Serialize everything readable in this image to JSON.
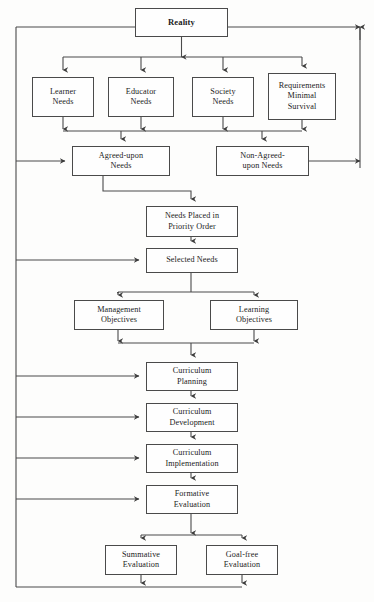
{
  "diagram": {
    "type": "flowchart",
    "background_color": "#fdfdfc",
    "line_color": "#4a4a4a",
    "text_color": "#1c1c1c",
    "nodes": [
      {
        "id": "reality",
        "label": "Reality",
        "x": 135,
        "y": 8,
        "w": 93,
        "h": 29,
        "bold": true
      },
      {
        "id": "learner-needs",
        "label": "Learner\nNeeds",
        "x": 32,
        "y": 77,
        "w": 62,
        "h": 40,
        "bold": false
      },
      {
        "id": "educator-needs",
        "label": "Educator\nNeeds",
        "x": 108,
        "y": 77,
        "w": 66,
        "h": 40,
        "bold": false
      },
      {
        "id": "society-needs",
        "label": "Society\nNeeds",
        "x": 192,
        "y": 77,
        "w": 62,
        "h": 40,
        "bold": false
      },
      {
        "id": "requirements-minimal-survival",
        "label": "Requirements\nMinimal\nSurvival",
        "x": 268,
        "y": 73,
        "w": 68,
        "h": 47,
        "bold": false
      },
      {
        "id": "agreed-upon-needs",
        "label": "Agreed-upon\nNeeds",
        "x": 72,
        "y": 146,
        "w": 98,
        "h": 30,
        "bold": false
      },
      {
        "id": "non-agreed-upon-needs",
        "label": "Non-Agreed-\nupon Needs",
        "x": 216,
        "y": 146,
        "w": 93,
        "h": 30,
        "bold": false
      },
      {
        "id": "needs-placed-priority",
        "label": "Needs Placed in\nPriority Order",
        "x": 146,
        "y": 206,
        "w": 92,
        "h": 31,
        "bold": false
      },
      {
        "id": "selected-needs",
        "label": "Selected Needs",
        "x": 146,
        "y": 248,
        "w": 92,
        "h": 25,
        "bold": false
      },
      {
        "id": "management-objectives",
        "label": "Management\nObjectives",
        "x": 74,
        "y": 300,
        "w": 90,
        "h": 30,
        "bold": false
      },
      {
        "id": "learning-objectives",
        "label": "Learning\nObjectives",
        "x": 210,
        "y": 300,
        "w": 88,
        "h": 30,
        "bold": false
      },
      {
        "id": "curriculum-planning",
        "label": "Curriculum\nPlanning",
        "x": 146,
        "y": 362,
        "w": 92,
        "h": 29,
        "bold": false
      },
      {
        "id": "curriculum-development",
        "label": "Curriculum\nDevelopment",
        "x": 146,
        "y": 403,
        "w": 92,
        "h": 29,
        "bold": false
      },
      {
        "id": "curriculum-implementation",
        "label": "Curriculum\nImplementation",
        "x": 146,
        "y": 444,
        "w": 92,
        "h": 29,
        "bold": false
      },
      {
        "id": "formative-evaluation",
        "label": "Formative\nEvaluation",
        "x": 146,
        "y": 485,
        "w": 92,
        "h": 29,
        "bold": false
      },
      {
        "id": "summative-evaluation",
        "label": "Summative\nEvaluation",
        "x": 105,
        "y": 545,
        "w": 72,
        "h": 30,
        "bold": false
      },
      {
        "id": "goal-free-evaluation",
        "label": "Goal-free\nEvaluation",
        "x": 206,
        "y": 545,
        "w": 72,
        "h": 30,
        "bold": false
      }
    ],
    "edges": [
      {
        "id": "reality-to-fanout",
        "from": "reality",
        "to": "needs-row"
      },
      {
        "id": "needs-to-agreed",
        "from": "needs-row",
        "to": "agreed-upon-needs"
      },
      {
        "id": "needs-to-non-agreed",
        "from": "needs-row",
        "to": "non-agreed-upon-needs"
      },
      {
        "id": "agreed-to-priority",
        "from": "agreed-upon-needs",
        "to": "needs-placed-priority"
      },
      {
        "id": "priority-to-selected",
        "from": "needs-placed-priority",
        "to": "selected-needs"
      },
      {
        "id": "selected-to-objectives",
        "from": "selected-needs",
        "to": "objectives-row"
      },
      {
        "id": "objectives-to-planning",
        "from": "objectives-row",
        "to": "curriculum-planning"
      },
      {
        "id": "planning-to-development",
        "from": "curriculum-planning",
        "to": "curriculum-development"
      },
      {
        "id": "development-to-implementation",
        "from": "curriculum-development",
        "to": "curriculum-implementation"
      },
      {
        "id": "implementation-to-formative",
        "from": "curriculum-implementation",
        "to": "formative-evaluation"
      },
      {
        "id": "formative-to-summative",
        "from": "formative-evaluation",
        "to": "summative-evaluation"
      },
      {
        "id": "formative-to-goal-free",
        "from": "formative-evaluation",
        "to": "goal-free-evaluation"
      },
      {
        "id": "feedback-left-loop",
        "from": "evaluation-row",
        "to": "left-feedback-bus"
      },
      {
        "id": "feedback-to-agreed",
        "from": "left-feedback-bus",
        "to": "agreed-upon-needs"
      },
      {
        "id": "feedback-to-selected",
        "from": "left-feedback-bus",
        "to": "selected-needs"
      },
      {
        "id": "feedback-to-planning",
        "from": "left-feedback-bus",
        "to": "curriculum-planning"
      },
      {
        "id": "feedback-to-development",
        "from": "left-feedback-bus",
        "to": "curriculum-development"
      },
      {
        "id": "feedback-to-implementation",
        "from": "left-feedback-bus",
        "to": "curriculum-implementation"
      },
      {
        "id": "feedback-to-formative",
        "from": "left-feedback-bus",
        "to": "formative-evaluation"
      },
      {
        "id": "non-agreed-to-reality",
        "from": "non-agreed-upon-needs",
        "to": "reality"
      }
    ]
  }
}
